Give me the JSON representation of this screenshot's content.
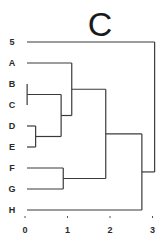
{
  "chart_data": {
    "type": "dendrogram",
    "title": "C",
    "xlabel": "",
    "ylabel": "",
    "orientation": "horizontal",
    "xlim": [
      0,
      3
    ],
    "x_ticks": [
      0,
      1,
      2,
      3
    ],
    "grid": false,
    "legend": null,
    "leaves": [
      "5",
      "A",
      "B",
      "C",
      "D",
      "E",
      "F",
      "G",
      "H"
    ],
    "merges": [
      {
        "id": "BC",
        "children": [
          "B",
          "C"
        ],
        "height": 0.05
      },
      {
        "id": "DE",
        "children": [
          "D",
          "E"
        ],
        "height": 0.25
      },
      {
        "id": "BCDE",
        "children": [
          "BC",
          "DE"
        ],
        "height": 0.85
      },
      {
        "id": "FG",
        "children": [
          "F",
          "G"
        ],
        "height": 0.9
      },
      {
        "id": "ABCDE",
        "children": [
          "A",
          "BCDE"
        ],
        "height": 1.1
      },
      {
        "id": "ABCDEFG",
        "children": [
          "ABCDE",
          "FG"
        ],
        "height": 1.9
      },
      {
        "id": "ABCDEFGH",
        "children": [
          "ABCDEFG",
          "H"
        ],
        "height": 2.75
      },
      {
        "id": "root",
        "children": [
          "5",
          "ABCDEFGH"
        ],
        "height": 3.05
      }
    ]
  },
  "labels": {
    "title": "C",
    "leaves": [
      "5",
      "A",
      "B",
      "C",
      "D",
      "E",
      "F",
      "G",
      "H"
    ],
    "ticks": [
      "0",
      "1",
      "2",
      "3"
    ]
  }
}
